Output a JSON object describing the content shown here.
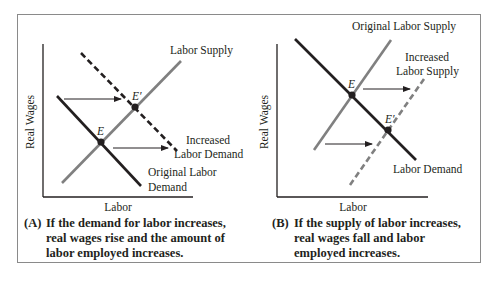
{
  "panels": [
    {
      "id": "A",
      "y_axis_label": "Real Wages",
      "x_axis_label": "Labor",
      "curves": {
        "supply": "Labor Supply",
        "demand_original_line1": "Original Labor",
        "demand_original_line2": "Demand",
        "demand_increased_line1": "Increased",
        "demand_increased_line2": "Labor Demand"
      },
      "points": {
        "E": "E",
        "E_prime": "E′"
      },
      "caption_tag": "(A)",
      "caption_text": "If the demand for labor increases, real wages rise and the amount of labor employed increases."
    },
    {
      "id": "B",
      "y_axis_label": "Real Wages",
      "x_axis_label": "Labor",
      "curves": {
        "supply_original": "Original Labor Supply",
        "supply_increased_line1": "Increased",
        "supply_increased_line2": "Labor Supply",
        "demand": "Labor Demand"
      },
      "points": {
        "E": "E",
        "E_prime": "E′"
      },
      "caption_tag": "(B)",
      "caption_text": "If the supply of labor increases, real wages fall and labor employed increases."
    }
  ],
  "colors": {
    "demand_line": "#231f20",
    "supply_line": "#808080",
    "axis": "#231f20",
    "frame": "#8a8a8a"
  }
}
